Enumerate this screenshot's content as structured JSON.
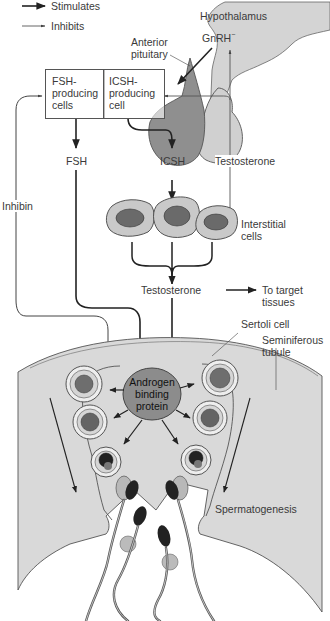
{
  "legend": {
    "stimulates": "Stimulates",
    "inhibits": "Inhibits"
  },
  "labels": {
    "hypothalamus": "Hypothalamus",
    "gnrh": "GnRH",
    "gnrh_sup": "−",
    "anterior_pituitary_1": "Anterior",
    "anterior_pituitary_2": "pituitary",
    "fsh_cells_1": "FSH-",
    "fsh_cells_2": "producing",
    "fsh_cells_3": "cells",
    "icsh_cell_1": "ICSH-",
    "icsh_cell_2": "producing",
    "icsh_cell_3": "cell",
    "fsh": "FSH",
    "icsh": "ICSH",
    "testosterone_feedback": "Testosterone",
    "inhibin": "Inhibin",
    "interstitial_1": "Interstitial",
    "interstitial_2": "cells",
    "testosterone": "Testosterone",
    "target_1": "To target",
    "target_2": "tissues",
    "sertoli": "Sertoli cell",
    "seminiferous_1": "Seminiferous",
    "seminiferous_2": "tubule",
    "abp_1": "Androgen",
    "abp_2": "binding",
    "abp_3": "protein",
    "spermatogenesis": "Spermatogenesis"
  },
  "colors": {
    "tubule_fill": "#d9d9d9",
    "hypothalamus_fill": "#d4d4d4",
    "pituitary_dark": "#8f8f8f",
    "pituitary_light": "#d0d0d0",
    "cell_fill": "#c9c9c9",
    "nucleus_fill": "#6a6a6a",
    "abp_fill": "#8c8c8c",
    "line": "#333333"
  }
}
